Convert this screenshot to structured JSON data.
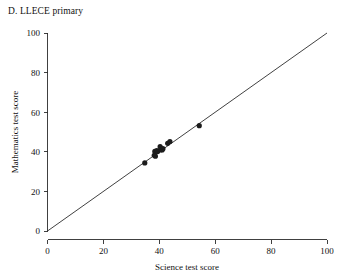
{
  "chart_data": {
    "type": "scatter",
    "title": "D. LLECE primary",
    "xlabel": "Science test score",
    "ylabel": "Mathematics test score",
    "xlim": [
      0,
      100
    ],
    "ylim": [
      0,
      100
    ],
    "xticks": [
      0,
      20,
      40,
      60,
      80,
      100
    ],
    "yticks": [
      0,
      20,
      40,
      60,
      80,
      100
    ],
    "xticklabels": [
      "0",
      "20",
      "40",
      "60",
      "80",
      "100"
    ],
    "yticklabels": [
      "0",
      "20",
      "40",
      "60",
      "80",
      "100"
    ],
    "grid": false,
    "legend": null,
    "reference_line": {
      "name": "identity-line",
      "description": "45 degree line y = x",
      "from": [
        0,
        0
      ],
      "to": [
        100,
        100
      ]
    },
    "points": [
      {
        "x": 34.8,
        "y": 34.4
      },
      {
        "x": 38.2,
        "y": 38.2
      },
      {
        "x": 38.4,
        "y": 40.2
      },
      {
        "x": 38.6,
        "y": 37.8
      },
      {
        "x": 39.1,
        "y": 40.6
      },
      {
        "x": 39.4,
        "y": 40.1
      },
      {
        "x": 40.3,
        "y": 42.6
      },
      {
        "x": 40.6,
        "y": 41.0
      },
      {
        "x": 41.0,
        "y": 40.9
      },
      {
        "x": 41.3,
        "y": 41.6
      },
      {
        "x": 43.0,
        "y": 44.3
      },
      {
        "x": 43.8,
        "y": 45.2
      },
      {
        "x": 54.3,
        "y": 53.2
      }
    ],
    "marker": {
      "shape": "circle",
      "size": 2.6,
      "color": "#1c1c1c"
    }
  },
  "axes": {
    "x_tick_labels": [
      "0",
      "20",
      "40",
      "60",
      "80",
      "100"
    ],
    "y_tick_labels": [
      "0",
      "20",
      "40",
      "60",
      "80",
      "100"
    ]
  }
}
